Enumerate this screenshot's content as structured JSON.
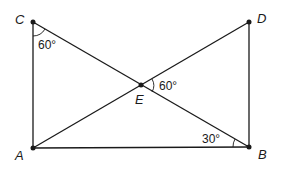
{
  "diagram": {
    "type": "geometry",
    "points": {
      "A": {
        "label": "A",
        "x": 33,
        "y": 148
      },
      "B": {
        "label": "B",
        "x": 249,
        "y": 147
      },
      "C": {
        "label": "C",
        "x": 33,
        "y": 22
      },
      "D": {
        "label": "D",
        "x": 249,
        "y": 22
      },
      "E": {
        "label": "E",
        "x": 141,
        "y": 85
      }
    },
    "segments": [
      "CA",
      "AB",
      "BD",
      "CB",
      "AD"
    ],
    "angles": [
      {
        "vertex": "C",
        "label": "60°"
      },
      {
        "vertex": "E",
        "label": "60°"
      },
      {
        "vertex": "B",
        "label": "30°"
      }
    ],
    "colors": {
      "line": "#1a1a1a",
      "background": "#ffffff"
    }
  }
}
